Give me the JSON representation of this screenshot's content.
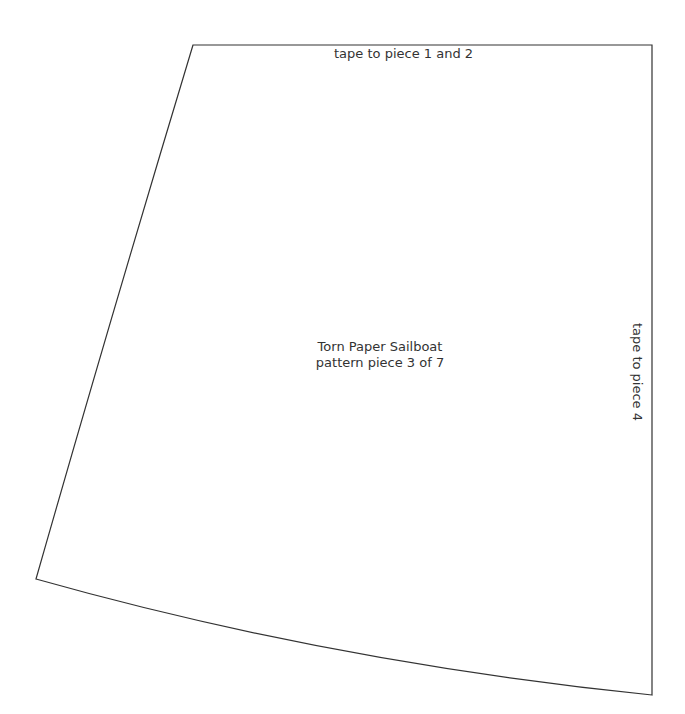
{
  "pattern": {
    "top_edge_label": "tape to piece 1 and 2",
    "right_edge_label": "tape to piece 4",
    "title": "Torn Paper Sailboat",
    "subtitle": "pattern piece 3 of 7",
    "stroke_color": "#333333",
    "background_color": "#ffffff"
  }
}
